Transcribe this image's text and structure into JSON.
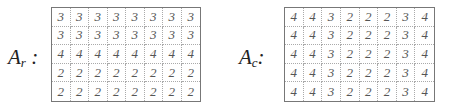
{
  "matrices": [
    {
      "label_base": "A",
      "label_sub": "r",
      "label_suffix": " :",
      "rows": [
        [
          "3",
          "3",
          "3",
          "3",
          "3",
          "3",
          "3",
          "3"
        ],
        [
          "3",
          "3",
          "3",
          "3",
          "3",
          "3",
          "3",
          "3"
        ],
        [
          "4",
          "4",
          "4",
          "4",
          "4",
          "4",
          "4",
          "4"
        ],
        [
          "2",
          "2",
          "2",
          "2",
          "2",
          "2",
          "2",
          "2"
        ],
        [
          "2",
          "2",
          "2",
          "2",
          "2",
          "2",
          "2",
          "2"
        ]
      ]
    },
    {
      "label_base": "A",
      "label_sub": "c",
      "label_suffix": ":",
      "rows": [
        [
          "4",
          "4",
          "3",
          "2",
          "2",
          "2",
          "3",
          "4"
        ],
        [
          "4",
          "4",
          "3",
          "2",
          "2",
          "2",
          "3",
          "4"
        ],
        [
          "4",
          "4",
          "3",
          "2",
          "2",
          "2",
          "3",
          "4"
        ],
        [
          "4",
          "4",
          "3",
          "2",
          "2",
          "2",
          "3",
          "4"
        ],
        [
          "4",
          "4",
          "3",
          "2",
          "2",
          "2",
          "3",
          "4"
        ]
      ]
    }
  ]
}
